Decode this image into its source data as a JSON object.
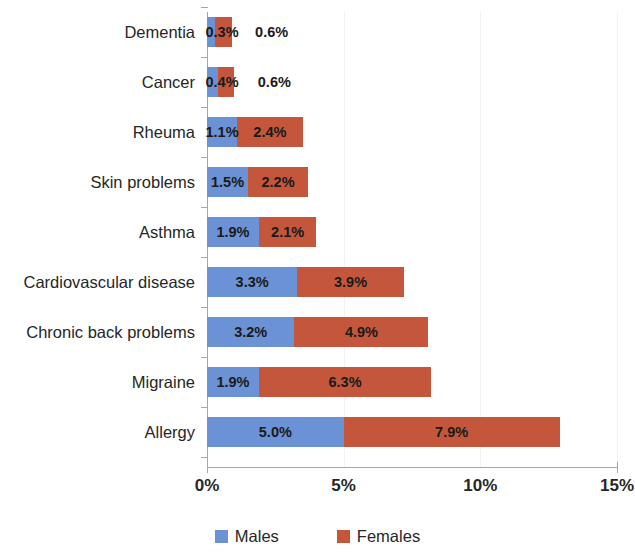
{
  "chart_data": {
    "type": "bar",
    "subtype": "stacked-horizontal",
    "title": "",
    "xlabel": "",
    "ylabel": "",
    "xlim": [
      0,
      15
    ],
    "xticks": [
      "0%",
      "5%",
      "10%",
      "15%"
    ],
    "xtick_values": [
      0,
      5,
      10,
      15
    ],
    "grid": true,
    "legend_position": "bottom",
    "categories": [
      "Dementia",
      "Cancer",
      "Rheuma",
      "Skin problems",
      "Asthma",
      "Cardiovascular disease",
      "Chronic back problems",
      "Migraine",
      "Allergy"
    ],
    "series": [
      {
        "name": "Males",
        "color": "#6A92D4",
        "values": [
          0.3,
          0.4,
          1.1,
          1.5,
          1.9,
          3.3,
          3.2,
          1.9,
          5.0
        ],
        "labels": [
          "0.3%",
          "0.4%",
          "1.1%",
          "1.5%",
          "1.9%",
          "3.3%",
          "3.2%",
          "1.9%",
          "5.0%"
        ]
      },
      {
        "name": "Females",
        "color": "#C4573B",
        "values": [
          0.6,
          0.6,
          2.4,
          2.2,
          2.1,
          3.9,
          4.9,
          6.3,
          7.9
        ],
        "labels": [
          "0.6%",
          "0.6%",
          "2.4%",
          "2.2%",
          "2.1%",
          "3.9%",
          "4.9%",
          "6.3%",
          "7.9%"
        ]
      }
    ],
    "totals": [
      0.9,
      1.0,
      3.5,
      3.7,
      4.0,
      7.2,
      8.1,
      8.2,
      12.9
    ]
  },
  "legend": {
    "items": [
      {
        "label": "Males",
        "color": "#6A92D4"
      },
      {
        "label": "Females",
        "color": "#C4573B"
      }
    ]
  }
}
